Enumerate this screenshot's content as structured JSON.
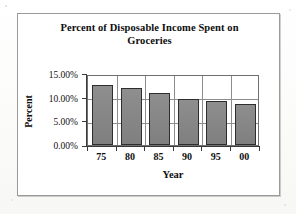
{
  "chart_data": {
    "type": "bar",
    "title": "Percent of Disposable Income Spent on Groceries",
    "title_line1": "Percent of Disposable Income Spent on",
    "title_line2": "Groceries",
    "xlabel": "Year",
    "ylabel": "Percent",
    "categories": [
      "75",
      "80",
      "85",
      "90",
      "95",
      "00"
    ],
    "values": [
      13.1,
      12.5,
      11.2,
      10.0,
      9.6,
      9.0
    ],
    "value_labels": [
      "13.1%",
      "12.5%",
      "11.2%",
      "10.0%",
      "9.6%",
      "9.0%"
    ],
    "ylim": [
      0,
      15
    ],
    "ytick_values": [
      0,
      5,
      10,
      15
    ],
    "ytick_labels": [
      "0.00%",
      "5.00%",
      "10.00%",
      "15.00%"
    ],
    "grid": true,
    "grid_orientation": "both",
    "legend": false,
    "legend_position": "none",
    "series": [
      {
        "name": "Percent of Disposable Income Spent on Groceries",
        "values": [
          13.1,
          12.5,
          11.2,
          10.0,
          9.6,
          9.0
        ]
      }
    ],
    "colors": {
      "bar_fill": "#878787",
      "bar_border": "#2e2e2e",
      "grid": "#8d8d8d",
      "axis": "#3a3a3a",
      "plot_border": "#6f6f6f",
      "frame_border": "#9a9a9a",
      "plot_background": "#ffffff",
      "page_background": "#fdfdfc",
      "text": "#101010"
    }
  }
}
